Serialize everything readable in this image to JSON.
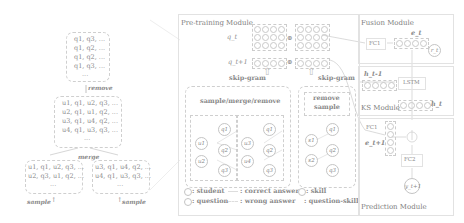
{
  "left_panel": {
    "top_box": [
      "q1, q3, ...",
      "q1, q2, ...",
      "q1, q2, ...",
      "q1, q3, ...",
      "..."
    ],
    "remove_label": "remove",
    "mid_box": [
      "u1, q1, u2, q3, ...",
      "u2, q1, u1, q2, ...",
      "u3, q1, u4, q2, ...",
      "u4, q1, u3, q3, ...",
      "..."
    ],
    "merge_label": "merge",
    "bottom_left_box": [
      "u1, q1, u2, q3, ...",
      "u2, q3, u1, q2, ...",
      "..."
    ],
    "bottom_right_box": [
      "u3, q1, u4, q2, ...",
      "u4, q1, u3, q3, ...",
      "..."
    ],
    "sample_left": "sample",
    "sample_right": "sample"
  },
  "pretraining": {
    "title": "Pre-training Module",
    "q_t": "q_t",
    "q_t1": "q_t+1",
    "skip_gram_left": "skip-gram",
    "skip_gram_right": "skip-gram",
    "smr_label": "sample/merge/remove",
    "remove_sample_label": "remove\nsample",
    "graph_left": {
      "students": [
        "u1",
        "u2"
      ],
      "questions": [
        "q1",
        "q2",
        "q3"
      ]
    },
    "graph_right": {
      "students": [
        "u3",
        "u4"
      ],
      "questions": [
        "q1",
        "q2",
        "q3"
      ]
    },
    "graph_skill": {
      "skills": [
        "s1",
        "s2"
      ],
      "questions": [
        "q1",
        "q2",
        "q3"
      ]
    },
    "legend": {
      "student": ": student",
      "question": ": question",
      "correct": ": correct answer",
      "wrong": ": wrong answer",
      "skill": ": skill",
      "question_skill": ": question-skill"
    }
  },
  "fusion": {
    "title": "Fusion Module",
    "fc1": "FC1",
    "e_t": "e_t",
    "r_t": "r_t"
  },
  "ks": {
    "title": "KS Module",
    "h_prev": "h_t-1",
    "lstm": "LSTM",
    "h_t": "h_t"
  },
  "prediction": {
    "title": "Prediction Module",
    "fc1": "FC1",
    "e_next": "e_t+1",
    "fc2": "FC2",
    "y_next": "y_t+1"
  }
}
